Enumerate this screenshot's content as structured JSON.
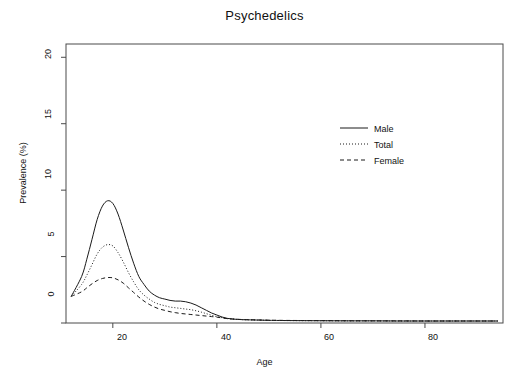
{
  "chart_data": {
    "type": "line",
    "title": "Psychedelics",
    "xlabel": "Age",
    "ylabel": "Prevalence (%)",
    "xlim": [
      11,
      95
    ],
    "ylim": [
      0,
      21
    ],
    "xticks": [
      20,
      40,
      60,
      80
    ],
    "yticks": [
      0,
      5,
      10,
      15,
      20
    ],
    "grid": false,
    "legend_position": "top-right-inside",
    "x": [
      12,
      14,
      15,
      16,
      17,
      18,
      19,
      20,
      21,
      22,
      23,
      24,
      25,
      26,
      27,
      28,
      29,
      30,
      31,
      32,
      33,
      34,
      35,
      36,
      37,
      38,
      39,
      40,
      41,
      42,
      43,
      44,
      45,
      46,
      48,
      50,
      52,
      55,
      60,
      65,
      70,
      75,
      80,
      85,
      90,
      94
    ],
    "series": [
      {
        "name": "Male",
        "style": "solid",
        "color": "#1a1a1a",
        "values": [
          2.0,
          3.5,
          4.8,
          6.3,
          7.8,
          8.8,
          9.2,
          9.0,
          8.2,
          7.0,
          5.7,
          4.5,
          3.5,
          2.9,
          2.4,
          2.1,
          1.9,
          1.8,
          1.7,
          1.65,
          1.65,
          1.6,
          1.5,
          1.35,
          1.15,
          0.95,
          0.75,
          0.6,
          0.45,
          0.35,
          0.3,
          0.27,
          0.25,
          0.24,
          0.22,
          0.2,
          0.19,
          0.18,
          0.17,
          0.16,
          0.16,
          0.15,
          0.15,
          0.15,
          0.15,
          0.15
        ]
      },
      {
        "name": "Total",
        "style": "dotted",
        "color": "#1a1a1a",
        "values": [
          2.0,
          2.9,
          3.6,
          4.4,
          5.2,
          5.7,
          5.9,
          5.8,
          5.3,
          4.6,
          3.8,
          3.1,
          2.5,
          2.1,
          1.8,
          1.55,
          1.4,
          1.3,
          1.2,
          1.15,
          1.1,
          1.05,
          1.0,
          0.92,
          0.82,
          0.7,
          0.58,
          0.48,
          0.4,
          0.33,
          0.3,
          0.27,
          0.25,
          0.24,
          0.22,
          0.2,
          0.19,
          0.18,
          0.17,
          0.16,
          0.16,
          0.15,
          0.15,
          0.15,
          0.15,
          0.15
        ]
      },
      {
        "name": "Female",
        "style": "dashed",
        "color": "#1a1a1a",
        "values": [
          2.0,
          2.35,
          2.65,
          2.95,
          3.2,
          3.35,
          3.42,
          3.4,
          3.25,
          3.0,
          2.65,
          2.3,
          1.95,
          1.65,
          1.4,
          1.2,
          1.05,
          0.95,
          0.85,
          0.78,
          0.72,
          0.68,
          0.64,
          0.6,
          0.56,
          0.52,
          0.48,
          0.44,
          0.38,
          0.33,
          0.3,
          0.28,
          0.26,
          0.25,
          0.23,
          0.21,
          0.2,
          0.19,
          0.18,
          0.17,
          0.16,
          0.16,
          0.15,
          0.15,
          0.15,
          0.15
        ]
      }
    ]
  },
  "legend": {
    "entries": [
      {
        "label": "Male",
        "style": "solid"
      },
      {
        "label": "Total",
        "style": "dotted"
      },
      {
        "label": "Female",
        "style": "dashed"
      }
    ]
  },
  "axis": {
    "x_tick_labels": [
      "20",
      "40",
      "60",
      "80"
    ],
    "y_tick_labels": [
      "0",
      "5",
      "10",
      "15",
      "20"
    ]
  },
  "colors": {
    "line": "#1a1a1a",
    "frame": "#4a4a4a",
    "background": "#ffffff"
  }
}
